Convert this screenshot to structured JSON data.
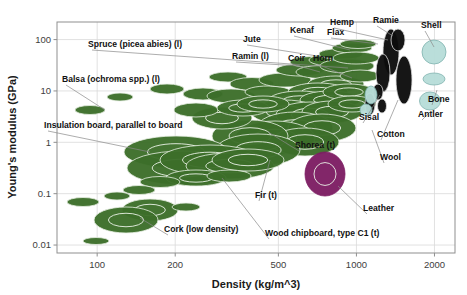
{
  "chart_data": {
    "type": "scatter",
    "title": "",
    "xlabel": "Density (kg/m^3)",
    "ylabel": "Young's modulus (GPa)",
    "xscale": "log",
    "yscale": "log",
    "xlim": [
      70,
      2400
    ],
    "ylim": [
      0.007,
      220
    ],
    "grid": true,
    "legend": "none",
    "xticks": [
      100,
      200,
      500,
      1000,
      2000
    ],
    "xtick_labels": [
      "100",
      "200",
      "500",
      "1000",
      "2000"
    ],
    "yticks": [
      0.01,
      0.1,
      1,
      10,
      100
    ],
    "ytick_labels": [
      "0.01",
      "0.1",
      "1",
      "10",
      "100"
    ],
    "groups": [
      {
        "name": "wood-and-natural-fibre-composites",
        "color": "#3c6e2a",
        "edge": "#e8f0e4"
      },
      {
        "name": "natural-fibres",
        "color": "#0d0d0d",
        "edge": "#dddddd"
      },
      {
        "name": "natural-materials-shell-bone",
        "color": "#b7ddd9",
        "edge": "#7fb3ae"
      },
      {
        "name": "leather",
        "color": "#7d1d63",
        "edge": "#7d1d63"
      }
    ],
    "annotations": [
      {
        "label": "Spruce (picea abies) (l)",
        "tx": 88,
        "ty": 47,
        "px": 348,
        "py": 68,
        "anchor": "start"
      },
      {
        "label": "Balsa (ochroma spp.) (l)",
        "tx": 62,
        "ty": 82,
        "px": 105,
        "py": 110,
        "anchor": "start"
      },
      {
        "label": "Insulation board, parallel to board",
        "tx": 44,
        "ty": 128,
        "px": 150,
        "py": 152,
        "anchor": "start"
      },
      {
        "label": "Jute",
        "tx": 243,
        "ty": 42,
        "px": 330,
        "py": 58,
        "anchor": "start"
      },
      {
        "label": "Kenaf",
        "tx": 290,
        "ty": 33,
        "px": 350,
        "py": 50,
        "anchor": "start"
      },
      {
        "label": "Flax",
        "tx": 327,
        "ty": 35,
        "px": 378,
        "py": 44,
        "anchor": "start"
      },
      {
        "label": "Hemp",
        "tx": 330,
        "ty": 25,
        "px": 388,
        "py": 40,
        "anchor": "start"
      },
      {
        "label": "Ramie",
        "tx": 373,
        "ty": 23,
        "px": 393,
        "py": 36,
        "anchor": "start"
      },
      {
        "label": "Ramin (l)",
        "tx": 232,
        "ty": 59,
        "px": 300,
        "py": 66,
        "anchor": "start"
      },
      {
        "label": "Coir",
        "tx": 288,
        "ty": 61,
        "px": 320,
        "py": 72,
        "anchor": "start"
      },
      {
        "label": "Horn",
        "tx": 313,
        "ty": 61,
        "px": 352,
        "py": 78,
        "anchor": "start"
      },
      {
        "label": "Shell",
        "tx": 421,
        "ty": 28,
        "px": 434,
        "py": 47,
        "anchor": "start"
      },
      {
        "label": "Bone",
        "tx": 428,
        "ty": 102,
        "px": 437,
        "py": 90,
        "anchor": "start"
      },
      {
        "label": "Antler",
        "tx": 418,
        "ty": 117,
        "px": 430,
        "py": 112,
        "anchor": "start"
      },
      {
        "label": "Sisal",
        "tx": 359,
        "ty": 120,
        "px": 380,
        "py": 95,
        "anchor": "start"
      },
      {
        "label": "Cotton",
        "tx": 377,
        "ty": 137,
        "px": 398,
        "py": 100,
        "anchor": "start"
      },
      {
        "label": "Wool",
        "tx": 380,
        "ty": 160,
        "px": 372,
        "py": 130,
        "anchor": "start"
      },
      {
        "label": "Shorea (t)",
        "tx": 295,
        "ty": 148,
        "px": 268,
        "py": 132,
        "anchor": "start"
      },
      {
        "label": "Leather",
        "tx": 363,
        "ty": 211,
        "px": 338,
        "py": 186,
        "anchor": "start"
      },
      {
        "label": "Fir (t)",
        "tx": 255,
        "ty": 198,
        "px": 270,
        "py": 160,
        "anchor": "start"
      },
      {
        "label": "Wood chipboard, type C1 (t)",
        "tx": 265,
        "ty": 236,
        "px": 222,
        "py": 178,
        "anchor": "start"
      },
      {
        "label": "Cork (low density)",
        "tx": 164,
        "ty": 232,
        "px": 140,
        "py": 218,
        "anchor": "start"
      }
    ],
    "bubbles": [
      {
        "g": 0,
        "cx": 90,
        "cy": 110,
        "rx": 15,
        "ry": 4.5
      },
      {
        "g": 0,
        "cx": 120,
        "cy": 97,
        "rx": 13,
        "ry": 4
      },
      {
        "g": 0,
        "cx": 167,
        "cy": 89,
        "rx": 17,
        "ry": 5
      },
      {
        "g": 0,
        "cx": 203,
        "cy": 94,
        "rx": 20,
        "ry": 6
      },
      {
        "g": 0,
        "cx": 228,
        "cy": 77,
        "rx": 19,
        "ry": 5
      },
      {
        "g": 0,
        "cx": 252,
        "cy": 84,
        "rx": 22,
        "ry": 6.5
      },
      {
        "g": 0,
        "cx": 231,
        "cy": 96,
        "rx": 24,
        "ry": 7
      },
      {
        "g": 0,
        "cx": 268,
        "cy": 92,
        "rx": 23,
        "ry": 6
      },
      {
        "g": 0,
        "cx": 285,
        "cy": 80,
        "rx": 26,
        "ry": 7
      },
      {
        "g": 0,
        "cx": 300,
        "cy": 70,
        "rx": 24,
        "ry": 6
      },
      {
        "g": 0,
        "cx": 312,
        "cy": 62,
        "rx": 22,
        "ry": 5.5
      },
      {
        "g": 0,
        "cx": 322,
        "cy": 72,
        "rx": 26,
        "ry": 6.5
      },
      {
        "g": 0,
        "cx": 333,
        "cy": 60,
        "rx": 24,
        "ry": 6
      },
      {
        "g": 0,
        "cx": 341,
        "cy": 54,
        "rx": 22,
        "ry": 5.5
      },
      {
        "g": 0,
        "cx": 347,
        "cy": 66,
        "rx": 27,
        "ry": 7
      },
      {
        "g": 0,
        "cx": 352,
        "cy": 48,
        "rx": 20,
        "ry": 5
      },
      {
        "g": 0,
        "cx": 356,
        "cy": 58,
        "rx": 23,
        "ry": 6
      },
      {
        "g": 0,
        "cx": 358,
        "cy": 44,
        "rx": 18,
        "ry": 4.5
      },
      {
        "g": 0,
        "cx": 336,
        "cy": 84,
        "rx": 28,
        "ry": 8
      },
      {
        "g": 0,
        "cx": 318,
        "cy": 92,
        "rx": 30,
        "ry": 9
      },
      {
        "g": 0,
        "cx": 300,
        "cy": 101,
        "rx": 32,
        "ry": 10
      },
      {
        "g": 0,
        "cx": 330,
        "cy": 100,
        "rx": 30,
        "ry": 9
      },
      {
        "g": 0,
        "cx": 349,
        "cy": 92,
        "rx": 26,
        "ry": 8
      },
      {
        "g": 0,
        "cx": 360,
        "cy": 76,
        "rx": 20,
        "ry": 6
      },
      {
        "g": 0,
        "cx": 285,
        "cy": 112,
        "rx": 34,
        "ry": 12
      },
      {
        "g": 0,
        "cx": 310,
        "cy": 115,
        "rx": 34,
        "ry": 13
      },
      {
        "g": 0,
        "cx": 332,
        "cy": 112,
        "rx": 30,
        "ry": 11
      },
      {
        "g": 0,
        "cx": 352,
        "cy": 104,
        "rx": 24,
        "ry": 8
      },
      {
        "g": 0,
        "cx": 295,
        "cy": 128,
        "rx": 38,
        "ry": 16
      },
      {
        "g": 0,
        "cx": 322,
        "cy": 128,
        "rx": 34,
        "ry": 14
      },
      {
        "g": 0,
        "cx": 275,
        "cy": 138,
        "rx": 40,
        "ry": 17
      },
      {
        "g": 0,
        "cx": 305,
        "cy": 142,
        "rx": 34,
        "ry": 14
      },
      {
        "g": 0,
        "cx": 250,
        "cy": 136,
        "rx": 38,
        "ry": 16
      },
      {
        "g": 0,
        "cx": 258,
        "cy": 150,
        "rx": 42,
        "ry": 16
      },
      {
        "g": 0,
        "cx": 222,
        "cy": 118,
        "rx": 30,
        "ry": 11
      },
      {
        "g": 0,
        "cx": 196,
        "cy": 110,
        "rx": 22,
        "ry": 7
      },
      {
        "g": 0,
        "cx": 243,
        "cy": 108,
        "rx": 26,
        "ry": 8
      },
      {
        "g": 0,
        "cx": 263,
        "cy": 104,
        "rx": 26,
        "ry": 8
      },
      {
        "g": 0,
        "cx": 176,
        "cy": 152,
        "rx": 52,
        "ry": 16
      },
      {
        "g": 0,
        "cx": 183,
        "cy": 168,
        "rx": 56,
        "ry": 17
      },
      {
        "g": 0,
        "cx": 210,
        "cy": 160,
        "rx": 50,
        "ry": 15
      },
      {
        "g": 0,
        "cx": 230,
        "cy": 166,
        "rx": 44,
        "ry": 13
      },
      {
        "g": 0,
        "cx": 248,
        "cy": 160,
        "rx": 36,
        "ry": 11
      },
      {
        "g": 0,
        "cx": 196,
        "cy": 178,
        "rx": 30,
        "ry": 8
      },
      {
        "g": 0,
        "cx": 229,
        "cy": 176,
        "rx": 22,
        "ry": 6
      },
      {
        "g": 0,
        "cx": 160,
        "cy": 182,
        "rx": 20,
        "ry": 5.5
      },
      {
        "g": 0,
        "cx": 139,
        "cy": 190,
        "rx": 16,
        "ry": 4.5
      },
      {
        "g": 0,
        "cx": 117,
        "cy": 196,
        "rx": 13,
        "ry": 4
      },
      {
        "g": 0,
        "cx": 83,
        "cy": 202,
        "rx": 16,
        "ry": 4.5
      },
      {
        "g": 0,
        "cx": 150,
        "cy": 210,
        "rx": 28,
        "ry": 11
      },
      {
        "g": 0,
        "cx": 126,
        "cy": 220,
        "rx": 32,
        "ry": 13
      },
      {
        "g": 0,
        "cx": 186,
        "cy": 207,
        "rx": 14,
        "ry": 4
      },
      {
        "g": 0,
        "cx": 96,
        "cy": 241,
        "rx": 13,
        "ry": 3.5
      },
      {
        "g": 1,
        "cx": 391,
        "cy": 52,
        "rx": 8,
        "ry": 23
      },
      {
        "g": 1,
        "cx": 383,
        "cy": 73,
        "rx": 7,
        "ry": 19
      },
      {
        "g": 1,
        "cx": 398,
        "cy": 40,
        "rx": 7,
        "ry": 11
      },
      {
        "g": 1,
        "cx": 404,
        "cy": 80,
        "rx": 8,
        "ry": 24
      },
      {
        "g": 1,
        "cx": 378,
        "cy": 92,
        "rx": 5,
        "ry": 8
      },
      {
        "g": 1,
        "cx": 370,
        "cy": 104,
        "rx": 5,
        "ry": 11
      },
      {
        "g": 1,
        "cx": 382,
        "cy": 106,
        "rx": 4.5,
        "ry": 7
      },
      {
        "g": 2,
        "cx": 434,
        "cy": 52,
        "rx": 12,
        "ry": 12
      },
      {
        "g": 2,
        "cx": 434,
        "cy": 79,
        "rx": 11,
        "ry": 6
      },
      {
        "g": 2,
        "cx": 430,
        "cy": 101,
        "rx": 10.5,
        "ry": 9
      },
      {
        "g": 2,
        "cx": 371,
        "cy": 95,
        "rx": 6,
        "ry": 9
      },
      {
        "g": 2,
        "cx": 366,
        "cy": 110,
        "rx": 6,
        "ry": 6
      },
      {
        "g": 3,
        "cx": 325,
        "cy": 174,
        "rx": 20,
        "ry": 22
      }
    ]
  }
}
